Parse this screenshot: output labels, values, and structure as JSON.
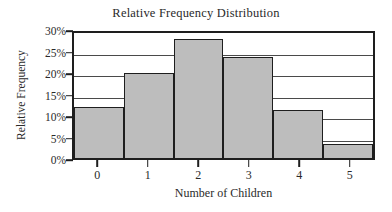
{
  "chart_data": {
    "type": "bar",
    "title": "Relative Frequency Distribution",
    "xlabel": "Number of Children",
    "ylabel": "Relative Frequency",
    "categories": [
      "0",
      "1",
      "2",
      "3",
      "4",
      "5"
    ],
    "values": [
      11.8,
      19.7,
      27.6,
      23.4,
      11.2,
      3.2
    ],
    "value_labels": [
      "11.8%",
      "19.7%",
      "27.6%",
      "23.4%",
      "11.2%",
      "3.2%"
    ],
    "ylim": [
      0,
      30
    ],
    "ytick_values": [
      0,
      5,
      10,
      15,
      20,
      25,
      30
    ],
    "ytick_labels": [
      "0%",
      "5%",
      "10%",
      "15%",
      "20%",
      "25%",
      "30%"
    ],
    "xtick_labels": [
      "0",
      "1",
      "2",
      "3",
      "4",
      "5"
    ],
    "grid": true,
    "grid_axis": "y",
    "legend": null,
    "bar_fill_color": "#bdbdbd",
    "bar_edge_color": "#1e1e1e",
    "axis_color": "#1e1e1e",
    "grid_color": "#4a4a4a",
    "background_color": "#ffffff",
    "bar_gap": 0
  }
}
